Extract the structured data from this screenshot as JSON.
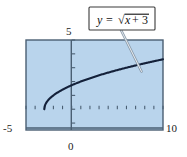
{
  "figure": {
    "name": "graph-of-square-root-function",
    "background_color": "#ffffff",
    "plot_fill_color": "#b9d4ec",
    "plot_border_color": "#4a5f73",
    "curve_color": "#14213a",
    "axis_color": "#4a5f73",
    "callout": {
      "label_parts": {
        "y": "y",
        "equals": "=",
        "radical": "√",
        "radicand_x": "x",
        "plus": "+",
        "radicand_const": "3"
      },
      "full_label": "y = √(x + 3)",
      "box_fill": "#ffffff",
      "box_border": "#3a3a3a",
      "leader_color": "#8a9bab"
    },
    "axis_labels": {
      "x_min": "-5",
      "x_max": "10",
      "y_max": "5",
      "origin": "0"
    }
  },
  "chart_data": {
    "type": "line",
    "title": "",
    "subtitle": "",
    "xlabel": "",
    "ylabel": "",
    "xlim": [
      -5,
      10
    ],
    "ylim": [
      -1.5,
      5
    ],
    "grid": false,
    "legend_position": "inside-callout",
    "annotations": [
      {
        "text": "y = √(x + 3)",
        "points_to_x": 7.3,
        "points_to_y": 3.2
      }
    ],
    "x_ticks": [
      -5,
      -4,
      -3,
      -2,
      -1,
      0,
      1,
      2,
      3,
      4,
      5,
      6,
      7,
      8,
      9,
      10
    ],
    "x_tick_labels": [
      "-5",
      "",
      "",
      "",
      "",
      "0",
      "",
      "",
      "",
      "",
      "",
      "",
      "",
      "",
      "",
      "10"
    ],
    "y_ticks": [
      -1,
      0,
      1,
      2,
      3,
      4,
      5
    ],
    "y_tick_labels": [
      "",
      "",
      "",
      "",
      "",
      "",
      "5"
    ],
    "series": [
      {
        "name": "y = √(x + 3)",
        "color": "#14213a",
        "domain_start": -3,
        "domain_end": 10,
        "x": [
          -3,
          -2.75,
          -2.5,
          -2.25,
          -2,
          -1.5,
          -1,
          -0.5,
          0,
          1,
          2,
          3,
          4,
          5,
          6,
          7,
          8,
          9,
          10
        ],
        "y": [
          0,
          0.5,
          0.707,
          0.866,
          1,
          1.225,
          1.414,
          1.581,
          1.732,
          2,
          2.236,
          2.449,
          2.646,
          2.828,
          3,
          3.162,
          3.317,
          3.464,
          3.606
        ]
      }
    ]
  }
}
